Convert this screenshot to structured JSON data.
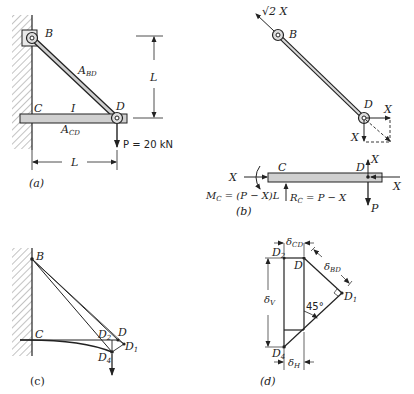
{
  "figure": {
    "panels": [
      {
        "id": "a",
        "caption": "(a)",
        "labels": {
          "B": "B",
          "C": "C",
          "D": "D",
          "I": "I",
          "A_BD": "A",
          "A_BD_sub": "BD",
          "A_CD": "A",
          "A_CD_sub": "CD",
          "L_vertical": "L",
          "L_horizontal": "L",
          "load": "P = 20 kN"
        }
      },
      {
        "id": "b",
        "caption": "(b)",
        "labels": {
          "B": "B",
          "D": "D",
          "C": "C",
          "D_beam": "D",
          "force_BD": "√2 X",
          "X_right": "X",
          "X_down": "X",
          "X_left_beam": "X",
          "X_right_beam": "X",
          "X_up": "X",
          "P": "P",
          "moment": "M",
          "moment_sub": "C",
          "moment_eq": " = (P − X)L",
          "reaction": "R",
          "reaction_sub": "C",
          "reaction_eq": " = P − X"
        }
      },
      {
        "id": "c",
        "caption": "(c)",
        "labels": {
          "B": "B",
          "C": "C",
          "D": "D",
          "D2": "D",
          "D2_sub": "2",
          "D1": "D",
          "D1_sub": "1",
          "D4": "D",
          "D4_sub": "4"
        }
      },
      {
        "id": "d",
        "caption": "(d)",
        "labels": {
          "D2": "D",
          "D2_sub": "2",
          "D": "D",
          "D1": "D",
          "D1_sub": "1",
          "D4": "D",
          "D4_sub": "4",
          "delta_CD": "δ",
          "delta_CD_sub": "CD",
          "delta_BD": "δ",
          "delta_BD_sub": "BD",
          "delta_V": "δ",
          "delta_V_sub": "V",
          "delta_H": "δ",
          "delta_H_sub": "H",
          "angle": "45°"
        }
      }
    ]
  }
}
